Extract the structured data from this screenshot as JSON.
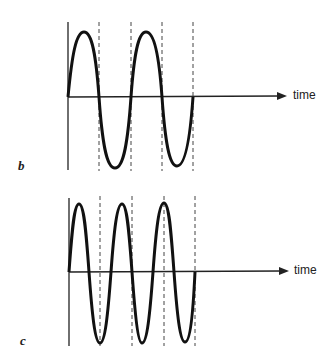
{
  "panels": [
    {
      "id": "b",
      "label": "b",
      "axis_label": "time",
      "cycles": 2,
      "description": "Sine wave with 2 full cycles; dashed lines mark half-period boundaries"
    },
    {
      "id": "c",
      "label": "c",
      "axis_label": "time",
      "cycles": 3,
      "description": "Sine wave with 3 full cycles over the same time span; dashed lines at same positions as panel b"
    }
  ],
  "colors": {
    "stroke": "#111111",
    "dash": "#333333",
    "background": "#ffffff"
  }
}
